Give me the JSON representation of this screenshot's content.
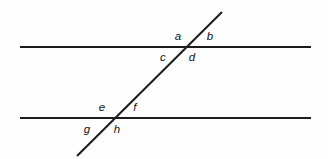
{
  "figure": {
    "kind": "geometry-diagram",
    "canvas": {
      "width": 328,
      "height": 159,
      "background": "#fefefe"
    },
    "style": {
      "line_color": "#1c1c1c",
      "line_width": 2,
      "label_color": "#121212",
      "label_font_size": 11.5,
      "label_style": "italic"
    },
    "lines": [
      {
        "name": "upper-parallel-line",
        "role": "parallel",
        "x1": 20,
        "y1": 47,
        "x2": 311,
        "y2": 47
      },
      {
        "name": "lower-parallel-line",
        "role": "parallel",
        "x1": 20,
        "y1": 118,
        "x2": 311,
        "y2": 118
      },
      {
        "name": "transversal-line",
        "role": "transversal",
        "x1": 222,
        "y1": 12,
        "x2": 77,
        "y2": 156
      }
    ],
    "intersections": [
      {
        "name": "upper-intersection",
        "x": 185,
        "y": 47
      },
      {
        "name": "lower-intersection",
        "x": 110,
        "y": 118
      }
    ],
    "labels": [
      {
        "id": "a",
        "text": "a",
        "x": 178,
        "y": 37,
        "intersection": "upper-intersection",
        "position": "upper-left"
      },
      {
        "id": "b",
        "text": "b",
        "x": 210,
        "y": 37,
        "intersection": "upper-intersection",
        "position": "upper-right"
      },
      {
        "id": "c",
        "text": "c",
        "x": 163,
        "y": 58,
        "intersection": "upper-intersection",
        "position": "lower-left"
      },
      {
        "id": "d",
        "text": "d",
        "x": 192,
        "y": 58,
        "intersection": "upper-intersection",
        "position": "lower-right"
      },
      {
        "id": "e",
        "text": "e",
        "x": 102,
        "y": 108,
        "intersection": "lower-intersection",
        "position": "upper-left"
      },
      {
        "id": "f",
        "text": "f",
        "x": 135,
        "y": 108,
        "intersection": "lower-intersection",
        "position": "upper-right"
      },
      {
        "id": "g",
        "text": "g",
        "x": 87,
        "y": 130,
        "intersection": "lower-intersection",
        "position": "lower-left"
      },
      {
        "id": "h",
        "text": "h",
        "x": 117,
        "y": 130,
        "intersection": "lower-intersection",
        "position": "lower-right"
      }
    ]
  }
}
